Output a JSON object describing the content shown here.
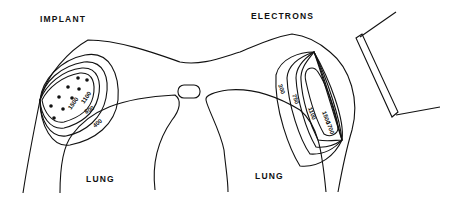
{
  "labels": {
    "implant": "IMPLANT",
    "electrons": "ELECTRONS",
    "lung_left": "LUNG",
    "lung_right": "LUNG"
  },
  "implant_isodose": [
    "1500",
    "1100",
    "800",
    "400"
  ],
  "electron_isodose": [
    "300",
    "750",
    "1100",
    "1500",
    "1700"
  ],
  "seed_count": 10
}
